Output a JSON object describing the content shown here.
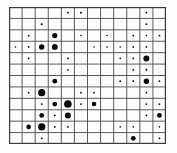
{
  "figure": {
    "title": "",
    "background_color": "#fdfdfc",
    "grid_color": "#4a4a4a",
    "frame_color": "#3a3a3a",
    "bubble_color": "#0a0a0a"
  },
  "chart_data": {
    "type": "scatter",
    "title": "",
    "subtitle": "",
    "xlabel": "",
    "ylabel": "",
    "grid": true,
    "legend": "none",
    "x_categories": [
      1,
      2,
      3,
      4,
      5,
      6,
      7,
      8,
      9,
      10,
      11,
      12
    ],
    "y_categories": [
      1,
      2,
      3,
      4,
      5,
      6,
      7,
      8,
      9,
      10,
      11,
      12
    ],
    "xlim": [
      0,
      12
    ],
    "ylim": [
      0,
      12
    ],
    "size_encoding": "radius",
    "size_min": 0.5,
    "size_max": 6.5,
    "points": [
      {
        "col": 5,
        "row": 1,
        "r": 0.9
      },
      {
        "col": 6,
        "row": 1,
        "r": 1.0
      },
      {
        "col": 11,
        "row": 1,
        "r": 0.9
      },
      {
        "col": 3,
        "row": 2,
        "r": 1.0
      },
      {
        "col": 11,
        "row": 2,
        "r": 0.9
      },
      {
        "col": 2,
        "row": 3,
        "r": 0.9
      },
      {
        "col": 4,
        "row": 3,
        "r": 2.6
      },
      {
        "col": 6,
        "row": 3,
        "r": 0.8
      },
      {
        "col": 8,
        "row": 3,
        "r": 0.8
      },
      {
        "col": 10,
        "row": 3,
        "r": 0.9
      },
      {
        "col": 11,
        "row": 3,
        "r": 0.8
      },
      {
        "col": 12,
        "row": 3,
        "r": 0.9
      },
      {
        "col": 1,
        "row": 4,
        "r": 0.8
      },
      {
        "col": 2,
        "row": 4,
        "r": 0.9
      },
      {
        "col": 3,
        "row": 4,
        "r": 2.7
      },
      {
        "col": 4,
        "row": 4,
        "r": 2.9
      },
      {
        "col": 7,
        "row": 4,
        "r": 0.8
      },
      {
        "col": 8,
        "row": 4,
        "r": 0.8
      },
      {
        "col": 9,
        "row": 4,
        "r": 0.8
      },
      {
        "col": 10,
        "row": 4,
        "r": 0.9
      },
      {
        "col": 11,
        "row": 4,
        "r": 0.9
      },
      {
        "col": 2,
        "row": 5,
        "r": 0.9
      },
      {
        "col": 5,
        "row": 5,
        "r": 0.9
      },
      {
        "col": 9,
        "row": 5,
        "r": 0.8
      },
      {
        "col": 10,
        "row": 5,
        "r": 0.9
      },
      {
        "col": 11,
        "row": 5,
        "r": 3.0
      },
      {
        "col": 5,
        "row": 6,
        "r": 0.9
      },
      {
        "col": 10,
        "row": 6,
        "r": 0.9
      },
      {
        "col": 11,
        "row": 6,
        "r": 1.0
      },
      {
        "col": 4,
        "row": 7,
        "r": 2.4
      },
      {
        "col": 9,
        "row": 7,
        "r": 0.9
      },
      {
        "col": 10,
        "row": 7,
        "r": 0.9
      },
      {
        "col": 11,
        "row": 7,
        "r": 2.7
      },
      {
        "col": 12,
        "row": 7,
        "r": 0.9
      },
      {
        "col": 2,
        "row": 8,
        "r": 0.9
      },
      {
        "col": 3,
        "row": 8,
        "r": 3.6
      },
      {
        "col": 6,
        "row": 8,
        "r": 0.9
      },
      {
        "col": 7,
        "row": 8,
        "r": 0.9
      },
      {
        "col": 11,
        "row": 8,
        "r": 0.9
      },
      {
        "col": 3,
        "row": 9,
        "r": 0.9
      },
      {
        "col": 4,
        "row": 9,
        "r": 2.4
      },
      {
        "col": 5,
        "row": 9,
        "r": 3.8
      },
      {
        "col": 6,
        "row": 9,
        "r": 0.9
      },
      {
        "col": 7,
        "row": 9,
        "r": 2.3
      },
      {
        "col": 11,
        "row": 9,
        "r": 0.9
      },
      {
        "col": 12,
        "row": 9,
        "r": 0.9
      },
      {
        "col": 3,
        "row": 10,
        "r": 2.4
      },
      {
        "col": 4,
        "row": 10,
        "r": 0.9
      },
      {
        "col": 5,
        "row": 10,
        "r": 3.0
      },
      {
        "col": 11,
        "row": 10,
        "r": 0.9
      },
      {
        "col": 12,
        "row": 10,
        "r": 2.4
      },
      {
        "col": 2,
        "row": 11,
        "r": 2.3
      },
      {
        "col": 3,
        "row": 11,
        "r": 3.6
      },
      {
        "col": 4,
        "row": 11,
        "r": 0.9
      },
      {
        "col": 5,
        "row": 11,
        "r": 0.9
      },
      {
        "col": 9,
        "row": 11,
        "r": 0.8
      },
      {
        "col": 10,
        "row": 11,
        "r": 0.8
      },
      {
        "col": 12,
        "row": 11,
        "r": 0.8
      },
      {
        "col": 3,
        "row": 12,
        "r": 0.9
      },
      {
        "col": 10,
        "row": 12,
        "r": 2.4
      },
      {
        "col": 12,
        "row": 12,
        "r": 0.9
      }
    ]
  },
  "geometry": {
    "left": 9,
    "top": 7,
    "width": 157,
    "height": 137,
    "cols": 12,
    "rows": 12
  }
}
